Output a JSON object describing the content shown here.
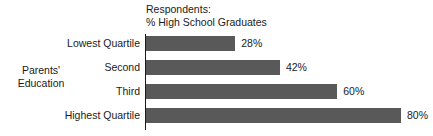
{
  "chart_data": {
    "type": "bar",
    "orientation": "horizontal",
    "title": "Respondents:\n% High School Graduates",
    "title_lines": [
      "Respondents:",
      "% High School Graduates"
    ],
    "ylabel": "Parents' Education",
    "ylabel_lines": [
      "Parents'",
      "Education"
    ],
    "xlabel": "",
    "categories": [
      "Lowest Quartile",
      "Second",
      "Third",
      "Highest Quartile"
    ],
    "values": [
      28,
      42,
      60,
      80
    ],
    "value_labels": [
      "28%",
      "42%",
      "60%",
      "80%"
    ],
    "xlim": [
      0,
      80
    ],
    "grid": false,
    "legend": null,
    "bar_color": "#595959",
    "axis_color": "#1a1a1a",
    "background_color": "#ffffff",
    "bars": [
      {
        "category": "Lowest Quartile",
        "value": 28,
        "label": "28%"
      },
      {
        "category": "Second",
        "value": 42,
        "label": "42%"
      },
      {
        "category": "Third",
        "value": 60,
        "label": "60%"
      },
      {
        "category": "Highest Quartile",
        "value": 80,
        "label": "80%"
      }
    ]
  }
}
